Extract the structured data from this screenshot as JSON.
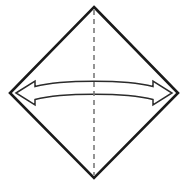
{
  "figure": {
    "canvas": {
      "width": 188,
      "height": 188,
      "background_color": "#ffffff"
    },
    "colors": {
      "outline": "#1a1a1a",
      "fold_line": "#7a7a7a",
      "arrow_stroke": "#2b2b2b",
      "arrow_fill": "#ffffff",
      "background": "#ffffff"
    },
    "shapes": {
      "diamond": {
        "name": "square-rotated-45",
        "points": "94,7 178,93 94,178 10,93",
        "stroke_width": 2.6,
        "fill": "#ffffff",
        "vertices": {
          "top": [
            94,
            7
          ],
          "right": [
            178,
            93
          ],
          "bottom": [
            94,
            178
          ],
          "left": [
            10,
            93
          ]
        }
      },
      "fold_line": {
        "name": "vertical-dashed-fold-line",
        "x": 94,
        "y_start": 10,
        "y_end": 175,
        "stroke_width": 1.6,
        "dash_pattern": "5 4"
      },
      "double_arrow": {
        "name": "horizontal-double-headed-curved-arrow",
        "direction": "bidirectional",
        "orientation": "horizontal",
        "left_tip": [
          16,
          93
        ],
        "right_tip": [
          172,
          93
        ],
        "arc_apex_y": 84,
        "stroke_width": 1.5,
        "outline_path": "M 16 93 L 35 81 L 35 86.5 C 62 79.5 126 79.5 153 86.5 L 153 81 L 172 93 L 153 105 L 153 99.5 C 126 92.5 62 92.5 35 99.5 L 35 105 Z"
      }
    }
  }
}
